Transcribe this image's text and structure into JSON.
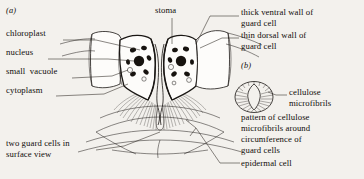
{
  "figure": {
    "background_color": "#f3f1ed",
    "ink_color": "#1a1714",
    "panels": [
      {
        "id": "a",
        "label": "(a)"
      },
      {
        "id": "b",
        "label": "(b)"
      }
    ]
  },
  "labels": {
    "panel_a": "(a)",
    "panel_b": "(b)",
    "chloroplast": "chloroplast",
    "nucleus": "nucleus",
    "small_vacuole": "small  vacuole",
    "cytoplasm": "cytoplasm",
    "two_guard_cells_line1": "two guard cells in",
    "two_guard_cells_line2": "surface view",
    "stoma": "stoma",
    "thick_ventral_line1": "thick ventral wall of",
    "thick_ventral_line2": "guard cell",
    "thin_dorsal_line1": "thin dorsal wall of",
    "thin_dorsal_line2": "guard cell",
    "cellulose_line1": "cellulose",
    "cellulose_line2": "microfibrils",
    "pattern_line1": "pattern of cellulose",
    "pattern_line2": "microfibrils around",
    "pattern_line3": "circumference of",
    "pattern_line4": "guard cells",
    "epidermal_cell": "epidermal cell"
  },
  "diagram_content": {
    "type": "biological-illustration",
    "subject": "stoma with guard cells",
    "panel_a_description": "transverse section through a stoma showing two guard cells with chloroplasts, nucleus and small vacuole, thick ventral wall, thin dorsal wall, adjoining epidermal cells, and the two guard cells seen in surface view below",
    "panel_b_description": "pattern of cellulose microfibrils arranged radially around the circumference of the guard cells",
    "structures": [
      "chloroplast",
      "nucleus",
      "small vacuole",
      "cytoplasm",
      "stoma",
      "thick ventral wall of guard cell",
      "thin dorsal wall of guard cell",
      "cellulose microfibrils",
      "epidermal cell",
      "two guard cells in surface view"
    ]
  }
}
